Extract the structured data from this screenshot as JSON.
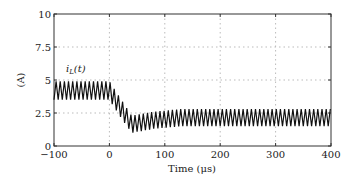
{
  "chart_data": {
    "type": "line",
    "title": "",
    "xlabel": "Time (μs)",
    "ylabel": "(A)",
    "xlim": [
      -100,
      400
    ],
    "ylim": [
      0,
      10
    ],
    "xticks": [
      -100,
      0,
      100,
      200,
      300,
      400
    ],
    "yticks": [
      0,
      2.5,
      5,
      7.5,
      10
    ],
    "xtick_labels": [
      "−100",
      "0",
      "100",
      "200",
      "300",
      "400"
    ],
    "ytick_labels": [
      "0",
      "2.5",
      "5",
      "7.5",
      "10"
    ],
    "grid": true,
    "annotation": "i_L(t)",
    "series": [
      {
        "name": "i_L(t)",
        "description": "Triangular ripple current; ~3.5-4.9 A before t=0, dips to ~1.0-2.3 A near t=40 μs, settles to ~1.5-2.8 A",
        "ripple_period_us": 7.5,
        "envelope": [
          {
            "t": -100,
            "min": 3.5,
            "max": 4.9
          },
          {
            "t": 0,
            "min": 3.5,
            "max": 4.9
          },
          {
            "t": 20,
            "min": 2.2,
            "max": 3.6
          },
          {
            "t": 40,
            "min": 1.0,
            "max": 2.3
          },
          {
            "t": 80,
            "min": 1.3,
            "max": 2.6
          },
          {
            "t": 130,
            "min": 1.5,
            "max": 2.8
          },
          {
            "t": 400,
            "min": 1.5,
            "max": 2.8
          }
        ]
      }
    ]
  }
}
